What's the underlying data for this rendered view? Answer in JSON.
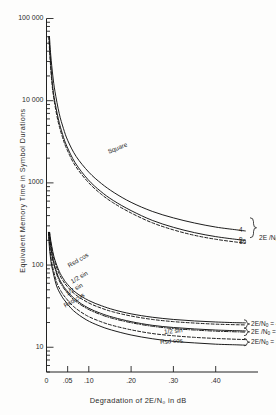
{
  "chart_data": {
    "type": "line",
    "title": "",
    "xlabel": "Degradation of 2E/N₀ in dB",
    "ylabel": "Equivalent Memory Time in Symbol Durations",
    "xscale": "linear",
    "yscale": "log",
    "xlim": [
      0,
      0.5
    ],
    "ylim": [
      5,
      100000
    ],
    "grid": false,
    "legend_position": "inline-labels",
    "xticks": [
      {
        "value": 0,
        "label": "0"
      },
      {
        "value": 0.05,
        "label": ".05"
      },
      {
        "value": 0.1,
        "label": ".10"
      },
      {
        "value": 0.2,
        "label": ".20"
      },
      {
        "value": 0.3,
        "label": ".30"
      },
      {
        "value": 0.4,
        "label": ".40"
      }
    ],
    "yticks": [
      {
        "value": 100000,
        "label": "100 000"
      },
      {
        "value": 10000,
        "label": "10 000"
      },
      {
        "value": 1000,
        "label": "1000"
      },
      {
        "value": 100,
        "label": "100"
      },
      {
        "value": 10,
        "label": "10"
      }
    ],
    "series": [
      {
        "name": "Square, 2E/N0 = 4",
        "style": "solid",
        "end_label": "4",
        "points": [
          [
            0.007,
            60000
          ],
          [
            0.01,
            36000
          ],
          [
            0.015,
            20000
          ],
          [
            0.02,
            13000
          ],
          [
            0.03,
            7000
          ],
          [
            0.04,
            4600
          ],
          [
            0.05,
            3300
          ],
          [
            0.07,
            2100
          ],
          [
            0.1,
            1350
          ],
          [
            0.13,
            980
          ],
          [
            0.16,
            760
          ],
          [
            0.2,
            580
          ],
          [
            0.25,
            450
          ],
          [
            0.3,
            375
          ],
          [
            0.35,
            325
          ],
          [
            0.4,
            290
          ],
          [
            0.45,
            268
          ],
          [
            0.47,
            260
          ]
        ]
      },
      {
        "name": "Square, 2E/N0 = 9",
        "style": "solid",
        "end_label": "9",
        "points": [
          [
            0.006,
            60000
          ],
          [
            0.009,
            33000
          ],
          [
            0.013,
            18000
          ],
          [
            0.018,
            11000
          ],
          [
            0.028,
            6000
          ],
          [
            0.038,
            3900
          ],
          [
            0.048,
            2800
          ],
          [
            0.068,
            1750
          ],
          [
            0.098,
            1100
          ],
          [
            0.128,
            790
          ],
          [
            0.158,
            610
          ],
          [
            0.2,
            460
          ],
          [
            0.25,
            350
          ],
          [
            0.3,
            288
          ],
          [
            0.35,
            248
          ],
          [
            0.4,
            222
          ],
          [
            0.45,
            205
          ],
          [
            0.47,
            200
          ]
        ]
      },
      {
        "name": "Square, 2E/N0 = 16",
        "style": "dashed",
        "end_label": "16",
        "points": [
          [
            0.0055,
            60000
          ],
          [
            0.0085,
            32000
          ],
          [
            0.0125,
            17000
          ],
          [
            0.0175,
            10500
          ],
          [
            0.027,
            5700
          ],
          [
            0.037,
            3700
          ],
          [
            0.047,
            2650
          ],
          [
            0.067,
            1650
          ],
          [
            0.097,
            1040
          ],
          [
            0.127,
            745
          ],
          [
            0.157,
            575
          ],
          [
            0.2,
            430
          ],
          [
            0.25,
            327
          ],
          [
            0.3,
            268
          ],
          [
            0.35,
            230
          ],
          [
            0.4,
            206
          ],
          [
            0.45,
            190
          ],
          [
            0.47,
            186
          ]
        ]
      },
      {
        "name": "Rsd cos, 2E/N0 = 4",
        "style": "solid",
        "end_label": "",
        "points": [
          [
            0.0075,
            250
          ],
          [
            0.01,
            200
          ],
          [
            0.015,
            145
          ],
          [
            0.02,
            115
          ],
          [
            0.03,
            84
          ],
          [
            0.04,
            68
          ],
          [
            0.05,
            58
          ],
          [
            0.07,
            46
          ],
          [
            0.1,
            37
          ],
          [
            0.13,
            32
          ],
          [
            0.16,
            28.5
          ],
          [
            0.2,
            25.5
          ],
          [
            0.25,
            23.2
          ],
          [
            0.3,
            21.8
          ],
          [
            0.35,
            20.9
          ],
          [
            0.4,
            20.3
          ],
          [
            0.45,
            19.9
          ],
          [
            0.47,
            19.8
          ]
        ]
      },
      {
        "name": "1/2 sin, 2E/N0 = 4",
        "style": "dashed",
        "end_label": "",
        "points": [
          [
            0.007,
            250
          ],
          [
            0.0095,
            195
          ],
          [
            0.0145,
            140
          ],
          [
            0.0195,
            110
          ],
          [
            0.029,
            80
          ],
          [
            0.039,
            64.5
          ],
          [
            0.049,
            55
          ],
          [
            0.069,
            43.5
          ],
          [
            0.099,
            34.8
          ],
          [
            0.129,
            30.0
          ],
          [
            0.159,
            26.8
          ],
          [
            0.2,
            24.0
          ],
          [
            0.25,
            21.8
          ],
          [
            0.3,
            20.5
          ],
          [
            0.35,
            19.7
          ],
          [
            0.4,
            19.1
          ],
          [
            0.45,
            18.8
          ],
          [
            0.47,
            18.7
          ]
        ]
      },
      {
        "name": "1/2 sin, 2E/N0 = 9",
        "style": "dashdot",
        "end_label": "",
        "points": [
          [
            0.006,
            250
          ],
          [
            0.0085,
            185
          ],
          [
            0.013,
            128
          ],
          [
            0.018,
            99
          ],
          [
            0.027,
            70
          ],
          [
            0.037,
            56
          ],
          [
            0.047,
            47.5
          ],
          [
            0.067,
            37.0
          ],
          [
            0.097,
            29.3
          ],
          [
            0.127,
            25.1
          ],
          [
            0.157,
            22.4
          ],
          [
            0.2,
            19.9
          ],
          [
            0.25,
            18.0
          ],
          [
            0.3,
            16.9
          ],
          [
            0.35,
            16.2
          ],
          [
            0.4,
            15.7
          ],
          [
            0.45,
            15.4
          ],
          [
            0.47,
            15.3
          ]
        ]
      },
      {
        "name": "Rsd cos, 2E/N0 = 9",
        "style": "solid",
        "end_label": "",
        "points": [
          [
            0.0062,
            250
          ],
          [
            0.0088,
            188
          ],
          [
            0.0134,
            131
          ],
          [
            0.0186,
            101
          ],
          [
            0.028,
            72
          ],
          [
            0.038,
            57.5
          ],
          [
            0.048,
            49
          ],
          [
            0.068,
            38.2
          ],
          [
            0.098,
            30.2
          ],
          [
            0.128,
            25.9
          ],
          [
            0.158,
            23.1
          ],
          [
            0.2,
            20.5
          ],
          [
            0.25,
            18.5
          ],
          [
            0.3,
            17.4
          ],
          [
            0.35,
            16.7
          ],
          [
            0.4,
            16.2
          ],
          [
            0.45,
            15.9
          ],
          [
            0.47,
            15.8
          ]
        ]
      },
      {
        "name": "1/2 sin, 2E/N0 = 16",
        "style": "dashed",
        "end_label": "",
        "points": [
          [
            0.005,
            250
          ],
          [
            0.0075,
            170
          ],
          [
            0.0115,
            114
          ],
          [
            0.0165,
            86
          ],
          [
            0.025,
            60
          ],
          [
            0.035,
            47.5
          ],
          [
            0.045,
            40.2
          ],
          [
            0.065,
            31.0
          ],
          [
            0.095,
            24.3
          ],
          [
            0.125,
            20.8
          ],
          [
            0.155,
            18.5
          ],
          [
            0.2,
            16.3
          ],
          [
            0.25,
            14.7
          ],
          [
            0.3,
            13.8
          ],
          [
            0.35,
            13.2
          ],
          [
            0.4,
            12.8
          ],
          [
            0.45,
            12.5
          ],
          [
            0.47,
            12.4
          ]
        ]
      },
      {
        "name": "Rsd cos, 2E/N0 = 16",
        "style": "solid",
        "end_label": "",
        "points": [
          [
            0.0046,
            250
          ],
          [
            0.007,
            162
          ],
          [
            0.011,
            107
          ],
          [
            0.016,
            80
          ],
          [
            0.024,
            55.5
          ],
          [
            0.034,
            43.5
          ],
          [
            0.044,
            36.5
          ],
          [
            0.064,
            27.8
          ],
          [
            0.094,
            21.6
          ],
          [
            0.124,
            18.3
          ],
          [
            0.154,
            16.2
          ],
          [
            0.2,
            14.1
          ],
          [
            0.25,
            12.7
          ],
          [
            0.3,
            11.8
          ],
          [
            0.35,
            11.3
          ],
          [
            0.4,
            10.9
          ],
          [
            0.45,
            10.7
          ],
          [
            0.47,
            10.6
          ]
        ]
      }
    ],
    "annotations": [
      {
        "id": "square-label",
        "text": "Square",
        "x": 0.145,
        "y": 2400,
        "rotation": -22
      },
      {
        "id": "rsdcos-upper",
        "text": "Rsd cos",
        "x": 0.052,
        "y": 98,
        "rotation": -30
      },
      {
        "id": "halfsin-upper",
        "text": "1/2 sin",
        "x": 0.058,
        "y": 62,
        "rotation": -30
      },
      {
        "id": "halfsin-mid",
        "text": "1/2 sin",
        "x": 0.047,
        "y": 45,
        "rotation": -30
      },
      {
        "id": "rsdcos-mid",
        "text": "Rsd cos",
        "x": 0.042,
        "y": 32,
        "rotation": -30
      },
      {
        "id": "halfsin-lower",
        "text": "1/2 sin",
        "x": 0.278,
        "y": 15.3,
        "rotation": -6
      },
      {
        "id": "rsdcos-lower",
        "text": "Rsd cos.",
        "x": 0.268,
        "y": 11.6,
        "rotation": -4
      }
    ],
    "group_labels": [
      {
        "id": "brace-upper",
        "text": "2E /N₀",
        "members": [
          "4",
          "9",
          "16"
        ]
      },
      {
        "id": "brace-mid-4",
        "text": "2E/N₀ = 4",
        "members": []
      },
      {
        "id": "brace-mid-9",
        "text": "2E /N₀ = 9",
        "members": []
      },
      {
        "id": "brace-mid-16",
        "text": "2E/N₀ = 16",
        "members": []
      }
    ],
    "end_labels": [
      "4",
      "9",
      "16"
    ]
  },
  "axes": {
    "x_axis_label": "Degradation of 2E/N₀ in dB",
    "y_axis_label": "Equivalent Memory Time in Symbol Durations"
  },
  "colors": {
    "ink": "#222222",
    "background": "#fdfdfc",
    "curve": "#111111"
  }
}
